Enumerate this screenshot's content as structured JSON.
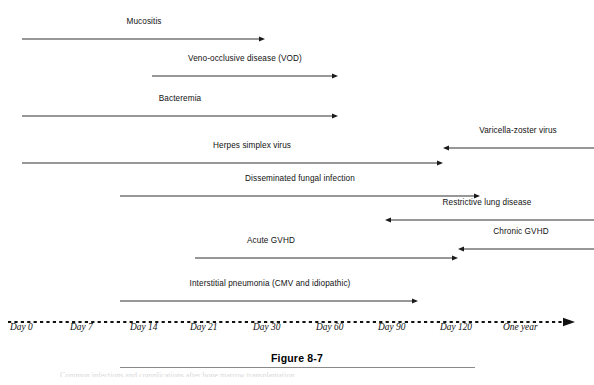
{
  "figure": {
    "caption_title": "Figure 8-7",
    "caption_subtext": "Common infections and complications after bone marrow transplantation.",
    "line_color": "#1a1a1a",
    "axis_color": "#111111"
  },
  "chart_data": {
    "type": "timeline",
    "title": "Figure 8-7",
    "xlabel": "",
    "ylabel": "",
    "grid": false,
    "legend": "none",
    "axis": {
      "style": "dashed",
      "arrow": "right",
      "tick_labels": [
        "Day 0",
        "Day 7",
        "Day 14",
        "Day 21",
        "Day 30",
        "Day 60",
        "Day 90",
        "Day 120",
        "One year"
      ],
      "tick_x": [
        10,
        70,
        130,
        190,
        253,
        316,
        378,
        440,
        503
      ]
    },
    "bars": [
      {
        "label": "Mucositis",
        "direction": "right",
        "x_start": 22,
        "x_end": 265,
        "y": 33,
        "label_x": 144,
        "label_y": 17,
        "start_span": "Day 0",
        "end_span": "Day 30"
      },
      {
        "label": "Veno-occlusive disease (VOD)",
        "direction": "right",
        "x_start": 152,
        "x_end": 338,
        "y": 70,
        "label_x": 245,
        "label_y": 54,
        "start_span": "Day 16",
        "end_span": "Day 65"
      },
      {
        "label": "Bacteremia",
        "direction": "right",
        "x_start": 22,
        "x_end": 338,
        "y": 110,
        "label_x": 180,
        "label_y": 94,
        "start_span": "Day 0",
        "end_span": "Day 65"
      },
      {
        "label": "Varicella-zoster virus",
        "direction": "left",
        "x_start": 594,
        "x_end": 443,
        "y": 142,
        "label_x": 518,
        "label_y": 126,
        "start_span": "One year",
        "end_span": "Day 120"
      },
      {
        "label": "Herpes simplex virus",
        "direction": "right",
        "x_start": 22,
        "x_end": 443,
        "y": 157,
        "label_x": 252,
        "label_y": 141,
        "start_span": "Day 0",
        "end_span": "Day 120"
      },
      {
        "label": "Disseminated fungal infection",
        "direction": "right",
        "x_start": 120,
        "x_end": 480,
        "y": 190,
        "label_x": 300,
        "label_y": 174,
        "start_span": "Day 12",
        "end_span": "Day 140"
      },
      {
        "label": "Restrictive lung disease",
        "direction": "left",
        "x_start": 594,
        "x_end": 385,
        "y": 214,
        "label_x": 487,
        "label_y": 198,
        "start_span": "One year",
        "end_span": "Day 92"
      },
      {
        "label": "Chronic GVHD",
        "direction": "left",
        "x_start": 594,
        "x_end": 458,
        "y": 243,
        "label_x": 521,
        "label_y": 227,
        "start_span": "One year",
        "end_span": "Day 125"
      },
      {
        "label": "Acute GVHD",
        "direction": "right",
        "x_start": 195,
        "x_end": 458,
        "y": 252,
        "label_x": 271,
        "label_y": 236,
        "start_span": "Day 21",
        "end_span": "Day 125"
      },
      {
        "label": "Interstitial pneumonia (CMV and idiopathic)",
        "direction": "right",
        "x_start": 120,
        "x_end": 418,
        "y": 295,
        "label_x": 270,
        "label_y": 279,
        "start_span": "Day 12",
        "end_span": "Day 108"
      }
    ]
  }
}
